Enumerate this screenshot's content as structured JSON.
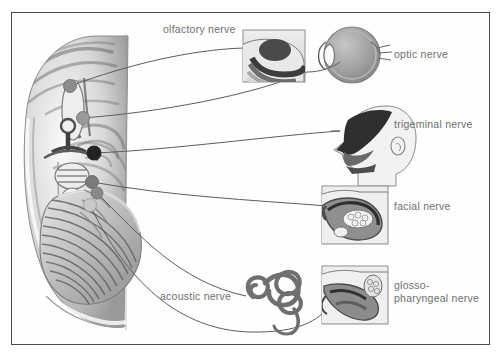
{
  "figure": {
    "background_color": "#ffffff",
    "frame_color": "#4a4a4a",
    "label_color": "#6f6f6f",
    "leader_color": "#5d5d5d"
  },
  "labels": {
    "olfactory": "olfactory nerve",
    "optic": "optic nerve",
    "trigeminal": "trigeminal nerve",
    "facial": "facial nerve",
    "acoustic": "acoustic nerve",
    "glossopharyngeal_line1": "glosso-",
    "glossopharyngeal_line2": "pharyngeal nerve"
  },
  "nerves": [
    {
      "name": "olfactory nerve",
      "marker": "origin-dot-olfactory",
      "x": 70,
      "y": 86,
      "r": 6.5,
      "color": "#8c8c8c",
      "target": "nasal-cavity-inset"
    },
    {
      "name": "optic nerve",
      "marker": "origin-dot-optic",
      "x": 83,
      "y": 118,
      "r": 6.5,
      "color": "#9a9a9a",
      "target": "eyeball-diagram"
    },
    {
      "name": "trigeminal nerve",
      "marker": "origin-dot-trigeminal",
      "x": 94,
      "y": 153,
      "r": 7.5,
      "color": "#242424",
      "target": "head-profile-diagram"
    },
    {
      "name": "facial nerve",
      "marker": "origin-dot-facial",
      "x": 92,
      "y": 182,
      "r": 6.5,
      "color": "#7b7b7b",
      "target": "mouth-tongue-inset"
    },
    {
      "name": "acoustic nerve",
      "marker": "origin-dot-acoustic",
      "x": 97,
      "y": 193,
      "r": 6.0,
      "color": "#8a8a8a",
      "target": "cochlea-diagram"
    },
    {
      "name": "glossopharyngeal nerve",
      "marker": "origin-dot-glossopharyngeal",
      "x": 90,
      "y": 205,
      "r": 6.5,
      "color": "#c9c9c9",
      "target": "pharynx-inset"
    }
  ],
  "organs": [
    {
      "name": "nasal-cavity-inset",
      "kind": "inset-box"
    },
    {
      "name": "eyeball-diagram",
      "kind": "eye"
    },
    {
      "name": "head-profile-diagram",
      "kind": "head"
    },
    {
      "name": "mouth-tongue-inset",
      "kind": "inset-box"
    },
    {
      "name": "cochlea-diagram",
      "kind": "inner-ear"
    },
    {
      "name": "pharynx-inset",
      "kind": "inset-box"
    }
  ]
}
